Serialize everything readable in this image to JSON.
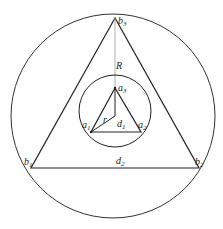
{
  "diagram": {
    "outer_circle": {
      "cx": 113,
      "cy": 116,
      "r": 102
    },
    "inner_circle": {
      "cx": 115,
      "cy": 111,
      "r": 36
    },
    "big_triangle": {
      "b1": [
        31,
        168
      ],
      "b2": [
        199,
        168
      ],
      "b3": [
        115,
        18
      ]
    },
    "small_triangle": {
      "a1": [
        91,
        132
      ],
      "a2": [
        141,
        132
      ],
      "a3": [
        115,
        88
      ]
    },
    "center": [
      115,
      116
    ],
    "labels": {
      "b3": {
        "base": "b",
        "sub": "3"
      },
      "b1": {
        "base": "b",
        "sub": "1"
      },
      "b2": {
        "base": "b",
        "sub": "2"
      },
      "a3": {
        "base": "a",
        "sub": "3"
      },
      "a1": {
        "base": "a",
        "sub": "1"
      },
      "a2": {
        "base": "a",
        "sub": "2"
      },
      "R": {
        "base": "R"
      },
      "r": {
        "base": "r"
      },
      "d1": {
        "base": "d",
        "sub": "1"
      },
      "d2": {
        "base": "d",
        "sub": "2"
      }
    }
  }
}
